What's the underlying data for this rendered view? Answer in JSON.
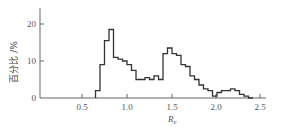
{
  "chart_data": {
    "type": "bar",
    "subtype": "histogram-step",
    "title": "",
    "xlabel": "R_e",
    "ylabel": "百分比 /%",
    "xlim": [
      0,
      2.7
    ],
    "ylim": [
      0,
      24
    ],
    "x_ticks": [
      "0.5",
      "1.0",
      "1.5",
      "2.0",
      "2.5"
    ],
    "y_ticks": [
      "0",
      "10",
      "20"
    ],
    "grid": false,
    "legend": null,
    "bin_width": 0.05,
    "bin_starts": [
      0.65,
      0.7,
      0.75,
      0.8,
      0.85,
      0.9,
      0.95,
      1.0,
      1.05,
      1.1,
      1.15,
      1.2,
      1.25,
      1.3,
      1.35,
      1.4,
      1.45,
      1.5,
      1.55,
      1.6,
      1.65,
      1.7,
      1.75,
      1.8,
      1.85,
      1.9,
      1.95,
      2.0,
      2.05,
      2.1,
      2.15,
      2.2,
      2.25,
      2.3,
      2.35
    ],
    "values": [
      2,
      9,
      15.5,
      18.5,
      11,
      10.5,
      10,
      9,
      7.5,
      5,
      5,
      5.5,
      5,
      6,
      5,
      12,
      13.5,
      12,
      11.5,
      9,
      8.5,
      6,
      5,
      3.5,
      2.5,
      2,
      0.5,
      1.5,
      2,
      2,
      2.5,
      2,
      1,
      0.5,
      0
    ]
  },
  "labels": {
    "ylabel": "百分比 /%",
    "xlabel_main": "R",
    "xlabel_sub": "e",
    "x_ticks": [
      "0.5",
      "1.0",
      "1.5",
      "2.0",
      "2.5"
    ],
    "y_ticks": [
      "0",
      "10",
      "20"
    ]
  }
}
